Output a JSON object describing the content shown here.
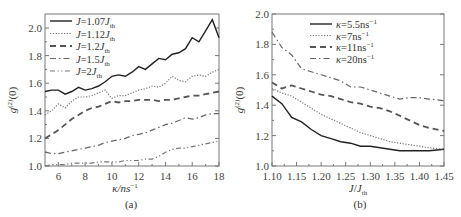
{
  "chart_data": [
    {
      "type": "line",
      "panel": "(a)",
      "xlabel": "κ/ns⁻¹",
      "ylabel": "g⁽²⁾(0)",
      "xlim": [
        5,
        18
      ],
      "ylim": [
        1.0,
        2.1
      ],
      "xticks": [
        6,
        8,
        10,
        12,
        14,
        16,
        18
      ],
      "yticks": [
        1.0,
        1.2,
        1.4,
        1.6,
        1.8,
        2.0
      ],
      "legend_position": "upper left",
      "x": [
        5,
        5.5,
        6,
        6.5,
        7,
        7.5,
        8,
        8.5,
        9,
        9.5,
        10,
        10.5,
        11,
        11.5,
        12,
        12.5,
        13,
        13.5,
        14,
        14.5,
        15,
        15.5,
        16,
        16.5,
        17,
        17.5,
        18
      ],
      "series": [
        {
          "name": "J=1.07J_th",
          "style": "solid",
          "values": [
            1.54,
            1.55,
            1.55,
            1.52,
            1.54,
            1.57,
            1.55,
            1.56,
            1.58,
            1.61,
            1.65,
            1.66,
            1.65,
            1.68,
            1.72,
            1.7,
            1.74,
            1.78,
            1.77,
            1.81,
            1.82,
            1.85,
            1.93,
            1.9,
            1.98,
            2.06,
            1.93
          ]
        },
        {
          "name": "J=1.12J_th",
          "style": "dotted",
          "values": [
            1.37,
            1.4,
            1.45,
            1.42,
            1.47,
            1.5,
            1.5,
            1.51,
            1.53,
            1.55,
            1.49,
            1.51,
            1.51,
            1.53,
            1.55,
            1.56,
            1.58,
            1.57,
            1.6,
            1.65,
            1.62,
            1.61,
            1.65,
            1.66,
            1.65,
            1.68,
            1.7
          ]
        },
        {
          "name": "J=1.2J_th",
          "style": "dashed",
          "values": [
            1.2,
            1.23,
            1.26,
            1.3,
            1.34,
            1.37,
            1.4,
            1.42,
            1.43,
            1.45,
            1.47,
            1.46,
            1.47,
            1.47,
            1.48,
            1.48,
            1.48,
            1.47,
            1.48,
            1.48,
            1.49,
            1.5,
            1.51,
            1.51,
            1.52,
            1.53,
            1.54
          ]
        },
        {
          "name": "J=1.5J_th",
          "style": "dashdot",
          "values": [
            1.1,
            1.09,
            1.09,
            1.1,
            1.11,
            1.12,
            1.13,
            1.14,
            1.15,
            1.17,
            1.18,
            1.19,
            1.2,
            1.22,
            1.23,
            1.24,
            1.26,
            1.28,
            1.3,
            1.31,
            1.33,
            1.35,
            1.34,
            1.35,
            1.37,
            1.38,
            1.38
          ]
        },
        {
          "name": "J=2J_th",
          "style": "dashdotdot",
          "values": [
            1.0,
            1.01,
            1.01,
            1.01,
            1.02,
            1.02,
            1.02,
            1.02,
            1.03,
            1.03,
            1.03,
            1.03,
            1.04,
            1.04,
            1.04,
            1.05,
            1.05,
            1.07,
            1.1,
            1.12,
            1.13,
            1.13,
            1.14,
            1.15,
            1.16,
            1.17,
            1.18
          ]
        }
      ]
    },
    {
      "type": "line",
      "panel": "(b)",
      "xlabel": "J/J_th",
      "ylabel": "g⁽²⁾(0)",
      "xlim": [
        1.1,
        1.45
      ],
      "ylim": [
        1.0,
        2.0
      ],
      "xticks": [
        1.1,
        1.15,
        1.2,
        1.25,
        1.3,
        1.35,
        1.4,
        1.45
      ],
      "yticks": [
        1.0,
        1.2,
        1.4,
        1.6,
        1.8,
        2.0
      ],
      "legend_position": "upper center",
      "x": [
        1.1,
        1.12,
        1.14,
        1.16,
        1.18,
        1.2,
        1.22,
        1.24,
        1.26,
        1.28,
        1.3,
        1.32,
        1.34,
        1.36,
        1.38,
        1.4,
        1.42,
        1.45
      ],
      "series": [
        {
          "name": "κ=5.5ns⁻¹",
          "style": "solid",
          "values": [
            1.46,
            1.41,
            1.32,
            1.29,
            1.24,
            1.2,
            1.18,
            1.16,
            1.15,
            1.13,
            1.13,
            1.12,
            1.11,
            1.1,
            1.1,
            1.1,
            1.1,
            1.11
          ]
        },
        {
          "name": "κ=7ns⁻¹",
          "style": "dotted",
          "values": [
            1.51,
            1.48,
            1.46,
            1.42,
            1.38,
            1.34,
            1.31,
            1.28,
            1.25,
            1.22,
            1.2,
            1.18,
            1.16,
            1.15,
            1.14,
            1.13,
            1.12,
            1.11
          ]
        },
        {
          "name": "κ=11ns⁻¹",
          "style": "dashed",
          "values": [
            1.55,
            1.51,
            1.53,
            1.51,
            1.49,
            1.47,
            1.46,
            1.44,
            1.42,
            1.41,
            1.39,
            1.38,
            1.36,
            1.33,
            1.3,
            1.27,
            1.25,
            1.23
          ]
        },
        {
          "name": "κ=20ns⁻¹",
          "style": "dashdot",
          "values": [
            1.88,
            1.78,
            1.73,
            1.64,
            1.62,
            1.6,
            1.58,
            1.56,
            1.52,
            1.52,
            1.5,
            1.48,
            1.46,
            1.44,
            1.45,
            1.45,
            1.44,
            1.43
          ]
        }
      ]
    }
  ],
  "panels": {
    "a": {
      "caption": "(a)",
      "xlabel": "κ/ns",
      "xlabel_sup": "−1",
      "ylabel": "g",
      "ylabel_sup": "(2)",
      "ylabel_tail": "(0)",
      "xticks": [
        "6",
        "8",
        "10",
        "12",
        "14",
        "16",
        "18"
      ],
      "yticks": [
        "1.0",
        "1.2",
        "1.4",
        "1.6",
        "1.8",
        "2.0"
      ],
      "legend": [
        {
          "pre": "J",
          "mid": "=1.07",
          "j": "J",
          "sub": "th"
        },
        {
          "pre": "J",
          "mid": "=1.12",
          "j": "J",
          "sub": "th"
        },
        {
          "pre": "J",
          "mid": "=1.2",
          "j": "J",
          "sub": "th"
        },
        {
          "pre": "J",
          "mid": "=1.5",
          "j": "J",
          "sub": "th"
        },
        {
          "pre": "J",
          "mid": "=2",
          "j": "J",
          "sub": "th"
        }
      ]
    },
    "b": {
      "caption": "(b)",
      "xlabel_a": "J",
      "xlabel_b": "/",
      "xlabel_c": "J",
      "xlabel_sub": "th",
      "ylabel": "g",
      "ylabel_sup": "(2)",
      "ylabel_tail": "(0)",
      "xticks": [
        "1.10",
        "1.15",
        "1.20",
        "1.25",
        "1.30",
        "1.35",
        "1.40",
        "1.45"
      ],
      "yticks": [
        "1.0",
        "1.2",
        "1.4",
        "1.6",
        "1.8",
        "2.0"
      ],
      "legend": [
        {
          "k": "κ",
          "val": "=5.5ns",
          "sup": "−1"
        },
        {
          "k": "κ",
          "val": "=7ns",
          "sup": "−1"
        },
        {
          "k": "κ",
          "val": "=11ns",
          "sup": "−1"
        },
        {
          "k": "κ",
          "val": "=20ns",
          "sup": "−1"
        }
      ]
    }
  }
}
